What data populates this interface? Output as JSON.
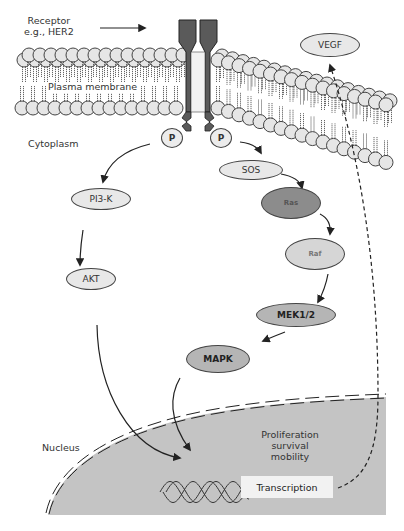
{
  "diagram": {
    "labels": {
      "receptor_line1": "Receptor",
      "receptor_line2": "e.g., HER2",
      "plasma_membrane": "Plasma membrane",
      "cytoplasm": "Cytoplasm",
      "nucleus": "Nucleus",
      "outcome_line1": "Proliferation",
      "outcome_line2": "survival",
      "outcome_line3": "mobility",
      "transcription": "Transcription"
    },
    "nodes": {
      "p_left": "P",
      "p_right": "P",
      "vegf": "VEGF",
      "sos": "SOS",
      "ras": "Ras",
      "raf": "Raf",
      "mek": "MEK1/2",
      "mapk": "MAPK",
      "pi3k": "PI3-K",
      "akt": "AKT"
    },
    "edges": [
      {
        "from": "p_left",
        "to": "pi3k",
        "style": "solid"
      },
      {
        "from": "pi3k",
        "to": "akt",
        "style": "solid"
      },
      {
        "from": "akt",
        "to": "nucleus",
        "style": "solid"
      },
      {
        "from": "p_right",
        "to": "sos",
        "style": "solid"
      },
      {
        "from": "sos",
        "to": "ras",
        "style": "solid"
      },
      {
        "from": "ras",
        "to": "raf",
        "style": "solid"
      },
      {
        "from": "raf",
        "to": "mek",
        "style": "solid"
      },
      {
        "from": "mek",
        "to": "mapk",
        "style": "solid"
      },
      {
        "from": "mapk",
        "to": "nucleus",
        "style": "solid"
      },
      {
        "from": "transcription",
        "to": "vegf",
        "style": "dashed"
      }
    ],
    "colors": {
      "receptor": "#5a5a5a",
      "lipid_head": "#e6e6e6",
      "nucleus_fill": "#c4c4c4",
      "node_light": "#e8e8e8",
      "node_mid": "#b5b5b5",
      "node_dark": "#8c8c8c",
      "line": "#222222"
    }
  }
}
